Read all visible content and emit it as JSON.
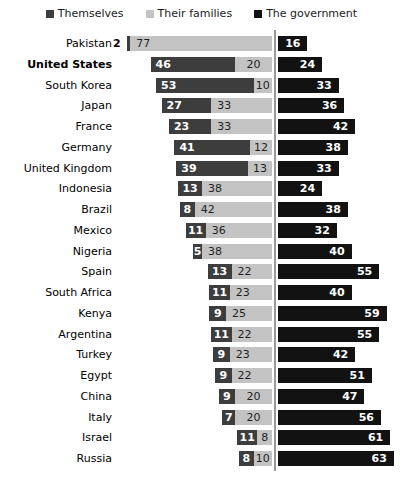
{
  "chart_data": {
    "type": "bar",
    "subtype": "horizontal-diverging-stacked",
    "title": "",
    "legend_position": "top",
    "legend": [
      "Themselves",
      "Their families",
      "The government"
    ],
    "categories": [
      "Pakistan",
      "United States",
      "South Korea",
      "Japan",
      "France",
      "Germany",
      "United Kingdom",
      "Indonesia",
      "Brazil",
      "Mexico",
      "Nigeria",
      "Spain",
      "South Africa",
      "Kenya",
      "Argentina",
      "Turkey",
      "Egypt",
      "China",
      "Italy",
      "Israel",
      "Russia"
    ],
    "highlighted_category": "United States",
    "series": [
      {
        "name": "Themselves",
        "values": [
          2,
          46,
          53,
          27,
          23,
          41,
          39,
          13,
          8,
          11,
          5,
          13,
          11,
          9,
          11,
          9,
          9,
          9,
          7,
          11,
          8
        ]
      },
      {
        "name": "Their families",
        "values": [
          77,
          20,
          10,
          33,
          33,
          12,
          13,
          38,
          42,
          36,
          38,
          22,
          23,
          25,
          22,
          23,
          22,
          20,
          20,
          8,
          10
        ]
      },
      {
        "name": "The government",
        "values": [
          16,
          24,
          33,
          36,
          42,
          38,
          33,
          24,
          38,
          32,
          40,
          55,
          40,
          59,
          55,
          42,
          51,
          47,
          56,
          61,
          63
        ]
      }
    ],
    "colors": {
      "themselves": "#3d3d3d",
      "their_families": "#c3c3c4",
      "the_government": "#121212",
      "divider_line": "#999999",
      "value_text_on_dark": "#ffffff",
      "value_text_on_light": "#1f1f1f",
      "label_text": "#000000",
      "background": "#ffffff"
    },
    "value_unit": "percent",
    "grid": false
  }
}
